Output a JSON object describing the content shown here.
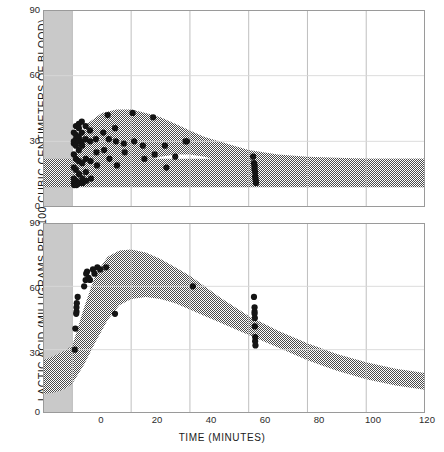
{
  "chart_data": {
    "type": "scatter",
    "title": "",
    "xlabel": "TIME (MINUTES)",
    "ylabel": "LACTIC ACID (MILLIGRAMS PER 100 CUBIC CENTIMETERS OF BLOOD)",
    "xlim": [
      -10,
      120
    ],
    "ylim": [
      0,
      90
    ],
    "xticks": [
      0,
      20,
      40,
      60,
      80,
      100,
      120
    ],
    "yticks": [
      0,
      30,
      60,
      90
    ],
    "grid": true,
    "legend": "none",
    "panels": [
      {
        "name": "upper-panel",
        "ylim": [
          0,
          90
        ],
        "yticks": [
          0,
          30,
          60,
          90
        ],
        "pre_exercise_shading": {
          "x_from": -10,
          "x_to": 0,
          "color": "#c9c9c9"
        },
        "bands": [
          {
            "name": "baseline-band",
            "note": "resting / control range, hatched",
            "x": [
              -10,
              0,
              10,
              20,
              30,
              40,
              50,
              60,
              70,
              80,
              90,
              100,
              110,
              120
            ],
            "upper": [
              22,
              22,
              22,
              22,
              22,
              22,
              22,
              22,
              22,
              22,
              22,
              22,
              22,
              22
            ],
            "lower": [
              9,
              9,
              9,
              9,
              9,
              9,
              9,
              9,
              9,
              9,
              9,
              9,
              9,
              9
            ]
          },
          {
            "name": "response-band",
            "note": "post-exercise lactic acid response envelope, hatched",
            "x": [
              0,
              5,
              10,
              15,
              20,
              25,
              30,
              35,
              40,
              45,
              50,
              55,
              60,
              70,
              80,
              90,
              100,
              110,
              120
            ],
            "upper": [
              22,
              38,
              43,
              44.5,
              44.5,
              43,
              41,
              38,
              35,
              32,
              30,
              28,
              26,
              24,
              23,
              22.5,
              22,
              22,
              22
            ],
            "lower": [
              9,
              10,
              12,
              15,
              18,
              21,
              23,
              24,
              24,
              23,
              21,
              19,
              17,
              14,
              12,
              11,
              10,
              9.5,
              9
            ]
          }
        ],
        "points": [
          [
            0.5,
            34
          ],
          [
            0.5,
            30
          ],
          [
            0.5,
            29
          ],
          [
            0.5,
            24
          ],
          [
            0.5,
            18
          ],
          [
            0.5,
            13
          ],
          [
            0.5,
            11
          ],
          [
            0.6,
            10
          ],
          [
            1.2,
            37
          ],
          [
            1.2,
            33
          ],
          [
            1.2,
            31
          ],
          [
            1.2,
            30
          ],
          [
            1.2,
            28
          ],
          [
            1.2,
            22
          ],
          [
            1.2,
            17
          ],
          [
            1.3,
            12
          ],
          [
            1.4,
            10
          ],
          [
            2.2,
            38
          ],
          [
            2.2,
            36
          ],
          [
            2.2,
            32
          ],
          [
            2.2,
            30
          ],
          [
            2.2,
            26
          ],
          [
            2.2,
            21
          ],
          [
            2.3,
            15
          ],
          [
            2.4,
            11
          ],
          [
            3.2,
            39
          ],
          [
            3.2,
            34
          ],
          [
            3.2,
            30
          ],
          [
            3.3,
            28
          ],
          [
            3.3,
            20
          ],
          [
            3.4,
            13
          ],
          [
            3.5,
            11
          ],
          [
            4.5,
            37
          ],
          [
            4.5,
            31
          ],
          [
            4.6,
            22
          ],
          [
            4.6,
            16
          ],
          [
            4.7,
            12
          ],
          [
            6.0,
            35
          ],
          [
            6.0,
            30
          ],
          [
            6.2,
            21
          ],
          [
            6.3,
            13
          ],
          [
            8.0,
            31
          ],
          [
            8.2,
            25
          ],
          [
            8.4,
            19
          ],
          [
            10.5,
            34
          ],
          [
            10.8,
            26
          ],
          [
            12.0,
            42
          ],
          [
            12.4,
            31
          ],
          [
            12.6,
            22
          ],
          [
            14.5,
            36
          ],
          [
            14.8,
            30
          ],
          [
            15.2,
            19
          ],
          [
            17.5,
            29
          ],
          [
            17.8,
            25
          ],
          [
            20.5,
            43
          ],
          [
            21.0,
            30
          ],
          [
            24.0,
            28
          ],
          [
            24.5,
            22
          ],
          [
            27.5,
            41
          ],
          [
            28.0,
            24
          ],
          [
            31.5,
            28
          ],
          [
            32.0,
            18
          ],
          [
            35.0,
            23
          ],
          [
            38.5,
            30
          ],
          [
            39.0,
            30
          ],
          [
            61.5,
            23
          ],
          [
            61.8,
            20
          ],
          [
            62.0,
            19
          ],
          [
            62.0,
            18
          ],
          [
            62.0,
            17
          ],
          [
            62.2,
            16
          ],
          [
            62.2,
            14
          ],
          [
            62.3,
            13
          ],
          [
            62.4,
            12
          ],
          [
            62.5,
            11
          ]
        ]
      },
      {
        "name": "lower-panel",
        "ylim": [
          0,
          90
        ],
        "yticks": [
          0,
          30,
          60,
          90
        ],
        "pre_exercise_shading": {
          "x_from": -10,
          "x_to": 0,
          "color": "#c9c9c9"
        },
        "bands": [
          {
            "name": "baseline-band",
            "note": "resting / control range rising toward exercise, hatched",
            "x": [
              -10,
              -7,
              -4,
              -2,
              0
            ],
            "upper": [
              25,
              26.5,
              28.5,
              30,
              32
            ],
            "lower": [
              9,
              9.5,
              10.5,
              12,
              14
            ]
          },
          {
            "name": "response-band",
            "note": "post-exercise lactic acid response envelope, hatched",
            "x": [
              0,
              4,
              8,
              12,
              16,
              20,
              25,
              30,
              35,
              40,
              45,
              50,
              60,
              70,
              80,
              90,
              100,
              110,
              120
            ],
            "upper": [
              32,
              50,
              66,
              74,
              77,
              77.5,
              76,
              73,
              69,
              65,
              60,
              55,
              46,
              39,
              33,
              28,
              24,
              21,
              19
            ],
            "lower": [
              14,
              23,
              34,
              44,
              51,
              54,
              55,
              54,
              52,
              49,
              46,
              43,
              37,
              31,
              25,
              20,
              16,
              13,
              11
            ]
          }
        ],
        "points": [
          [
            0.8,
            30
          ],
          [
            1.0,
            40
          ],
          [
            1.3,
            47
          ],
          [
            1.4,
            48
          ],
          [
            1.4,
            50
          ],
          [
            1.5,
            52
          ],
          [
            1.8,
            55
          ],
          [
            4.0,
            60
          ],
          [
            4.5,
            63
          ],
          [
            4.7,
            66
          ],
          [
            5.0,
            67
          ],
          [
            5.5,
            64
          ],
          [
            6.0,
            63
          ],
          [
            7.0,
            68
          ],
          [
            7.5,
            66
          ],
          [
            8.5,
            69
          ],
          [
            9.5,
            68
          ],
          [
            11.5,
            69
          ],
          [
            14.5,
            47
          ],
          [
            41.0,
            60
          ],
          [
            61.8,
            55
          ],
          [
            62.0,
            50
          ],
          [
            62.0,
            48
          ],
          [
            62.0,
            47
          ],
          [
            62.1,
            45
          ],
          [
            62.1,
            41
          ],
          [
            62.2,
            36
          ],
          [
            62.2,
            34
          ],
          [
            62.3,
            32
          ]
        ]
      }
    ]
  },
  "axes": {
    "upper_yticks": [
      "90",
      "60",
      "30",
      "0"
    ],
    "lower_yticks": [
      "90",
      "60",
      "30",
      "0"
    ],
    "xticks": [
      "0",
      "20",
      "40",
      "60",
      "80",
      "100",
      "120"
    ]
  },
  "style": {
    "shade_gray": "#c9c9c9",
    "grid_color": "#b8b8b8",
    "frame_color": "#9a9a9a",
    "point_color": "#141414",
    "hatch_color": "#4a4a4a"
  }
}
